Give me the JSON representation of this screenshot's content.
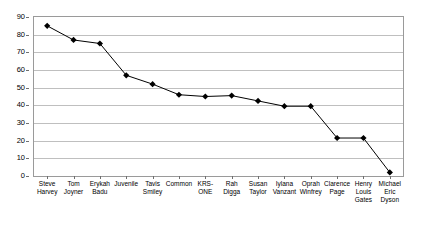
{
  "chart_data": {
    "type": "line",
    "title": "",
    "subtitle": "",
    "xlabel": "",
    "ylabel": "",
    "ylim": [
      0,
      90
    ],
    "ytick_step": 10,
    "yticks": [
      0,
      10,
      20,
      30,
      40,
      50,
      60,
      70,
      80,
      90
    ],
    "grid": true,
    "legend": false,
    "marker": "diamond",
    "marker_color": "#000000",
    "line_color": "#000000",
    "categories": [
      "Steve\nHarvey",
      "Tom\nJoyner",
      "Erykah\nBadu",
      "Juvenile",
      "Tavis\nSmiley",
      "Common",
      "KRS-\nONE",
      "Rah\nDigga",
      "Susan\nTaylor",
      "Iylana\nVanzant",
      "Oprah\nWinfrey",
      "Clarence\nPage",
      "Henry\nLouis\nGates",
      "Michael\nEric\nDyson"
    ],
    "values": [
      85,
      77,
      75,
      57,
      52,
      46,
      45,
      45.5,
      42.5,
      39.5,
      39.5,
      21.5,
      21.5,
      2
    ]
  }
}
